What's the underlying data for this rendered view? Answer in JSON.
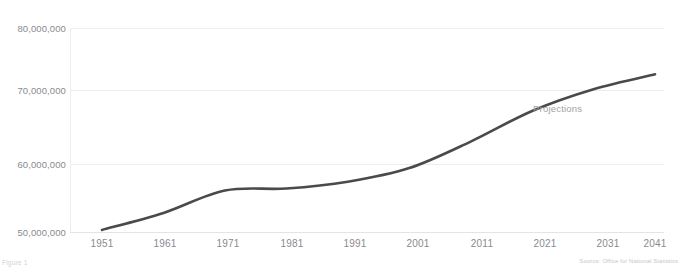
{
  "figure": {
    "caption": "Figure 1",
    "source_note": "Source: Office for National Statistics"
  },
  "annotations": {
    "projections_label": "Projections"
  },
  "colors": {
    "line": "#4a4a4a",
    "gridline": "#ededee",
    "tick_text": "#8a8a8d",
    "annotation_text": "#a2a2a5",
    "background": "#ffffff"
  },
  "chart_data": {
    "type": "line",
    "title": "",
    "subtitle": "",
    "xlabel": "",
    "ylabel": "",
    "xlim": [
      1951,
      2041
    ],
    "ylim": [
      50000000,
      80000000
    ],
    "grid": true,
    "legend": "none",
    "x_tick_labels": [
      "1951",
      "1961",
      "1971",
      "1981",
      "1991",
      "2001",
      "2011",
      "2021",
      "2031",
      "2041"
    ],
    "y_tick_labels": [
      "80,000,000",
      "70,000,000",
      "60,000,000",
      "50,000,000"
    ],
    "y_tick_values": [
      80000000,
      70000000,
      60000000,
      50000000
    ],
    "series": [
      {
        "name": "Population",
        "x": [
          1951,
          1961,
          1971,
          1981,
          1991,
          2001,
          2011,
          2021,
          2031,
          2041
        ],
        "values": [
          50300000,
          52800000,
          56100000,
          56400000,
          57400000,
          59400000,
          63300000,
          67800000,
          71000000,
          73200000
        ]
      }
    ],
    "annotation_points": [
      {
        "label": "Projections",
        "x": 2023,
        "y": 66300000
      }
    ]
  }
}
